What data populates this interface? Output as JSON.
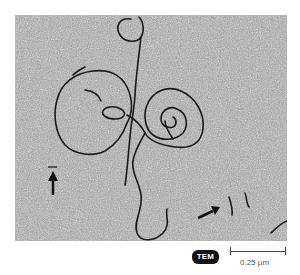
{
  "figure": {
    "badge": "TEM",
    "scale_bar": {
      "label": "0.25 μm"
    },
    "annotations": [
      {
        "type": "arrow",
        "direction": "up",
        "position": "left"
      },
      {
        "type": "arrow",
        "direction": "up-right",
        "position": "bottom-right"
      }
    ],
    "colors": {
      "background_noise_base": "#9a9a9a",
      "strand": "#1a1a1a",
      "badge_bg": "#111111",
      "badge_text": "#ffffff"
    }
  }
}
